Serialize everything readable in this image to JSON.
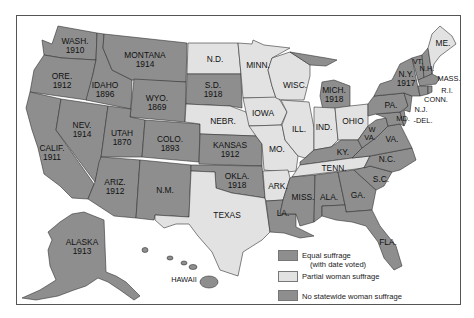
{
  "map": {
    "title": "",
    "colors": {
      "equal": "#8e8e8e",
      "partial": "#e2e2e2",
      "none": "#8e8e8e",
      "border": "#333333",
      "frame": "#555555"
    },
    "states": [
      {
        "id": "wa",
        "abbr": "WASH.",
        "year": "1910",
        "status": "equal"
      },
      {
        "id": "or",
        "abbr": "ORE.",
        "year": "1912",
        "status": "equal"
      },
      {
        "id": "ca",
        "abbr": "CALIF.",
        "year": "1911",
        "status": "equal"
      },
      {
        "id": "id",
        "abbr": "IDAHO",
        "year": "1896",
        "status": "equal"
      },
      {
        "id": "nv",
        "abbr": "NEV.",
        "year": "1914",
        "status": "equal"
      },
      {
        "id": "mt",
        "abbr": "MONTANA",
        "year": "1914",
        "status": "equal"
      },
      {
        "id": "wy",
        "abbr": "WYO.",
        "year": "1869",
        "status": "equal"
      },
      {
        "id": "ut",
        "abbr": "UTAH",
        "year": "1870",
        "status": "equal"
      },
      {
        "id": "co",
        "abbr": "COLO.",
        "year": "1893",
        "status": "equal"
      },
      {
        "id": "az",
        "abbr": "ARIZ.",
        "year": "1912",
        "status": "equal"
      },
      {
        "id": "nm",
        "abbr": "N.M.",
        "year": "",
        "status": "none"
      },
      {
        "id": "nd",
        "abbr": "N.D.",
        "year": "",
        "status": "partial"
      },
      {
        "id": "sd",
        "abbr": "S.D.",
        "year": "1918",
        "status": "equal"
      },
      {
        "id": "ne",
        "abbr": "NEBR.",
        "year": "",
        "status": "partial"
      },
      {
        "id": "ks",
        "abbr": "KANSAS",
        "year": "1912",
        "status": "equal"
      },
      {
        "id": "ok",
        "abbr": "OKLA.",
        "year": "1918",
        "status": "equal"
      },
      {
        "id": "tx",
        "abbr": "TEXAS",
        "year": "",
        "status": "partial"
      },
      {
        "id": "mn",
        "abbr": "MINN.",
        "year": "",
        "status": "partial"
      },
      {
        "id": "ia",
        "abbr": "IOWA",
        "year": "",
        "status": "partial"
      },
      {
        "id": "mo",
        "abbr": "MO.",
        "year": "",
        "status": "partial"
      },
      {
        "id": "ar",
        "abbr": "ARK.",
        "year": "",
        "status": "partial"
      },
      {
        "id": "la",
        "abbr": "LA.",
        "year": "",
        "status": "none"
      },
      {
        "id": "wi",
        "abbr": "WISC.",
        "year": "",
        "status": "partial"
      },
      {
        "id": "il",
        "abbr": "ILL.",
        "year": "",
        "status": "partial"
      },
      {
        "id": "mi",
        "abbr": "MICH.",
        "year": "1918",
        "status": "equal"
      },
      {
        "id": "in",
        "abbr": "IND.",
        "year": "",
        "status": "partial"
      },
      {
        "id": "oh",
        "abbr": "OHIO",
        "year": "",
        "status": "partial"
      },
      {
        "id": "ky",
        "abbr": "KY.",
        "year": "",
        "status": "none"
      },
      {
        "id": "tn",
        "abbr": "TENN.",
        "year": "",
        "status": "partial"
      },
      {
        "id": "ms",
        "abbr": "MISS.",
        "year": "",
        "status": "none"
      },
      {
        "id": "al",
        "abbr": "ALA.",
        "year": "",
        "status": "none"
      },
      {
        "id": "ga",
        "abbr": "GA.",
        "year": "",
        "status": "none"
      },
      {
        "id": "fl",
        "abbr": "FLA.",
        "year": "",
        "status": "none"
      },
      {
        "id": "sc",
        "abbr": "S.C.",
        "year": "",
        "status": "none"
      },
      {
        "id": "nc",
        "abbr": "N.C.",
        "year": "",
        "status": "none"
      },
      {
        "id": "va",
        "abbr": "VA.",
        "year": "",
        "status": "none"
      },
      {
        "id": "wv",
        "abbr": "W\nVA.",
        "year": "",
        "status": "none"
      },
      {
        "id": "md",
        "abbr": "MD.",
        "year": "",
        "status": "none"
      },
      {
        "id": "de",
        "abbr": "DEL.",
        "year": "",
        "status": "none"
      },
      {
        "id": "pa",
        "abbr": "PA.",
        "year": "",
        "status": "none"
      },
      {
        "id": "nj",
        "abbr": "N.J.",
        "year": "",
        "status": "none"
      },
      {
        "id": "ny",
        "abbr": "N.Y.",
        "year": "1917",
        "status": "equal"
      },
      {
        "id": "ct",
        "abbr": "CONN.",
        "year": "",
        "status": "none"
      },
      {
        "id": "ri",
        "abbr": "R.I.",
        "year": "",
        "status": "none"
      },
      {
        "id": "ma",
        "abbr": "MASS.",
        "year": "",
        "status": "none"
      },
      {
        "id": "vt",
        "abbr": "VT.",
        "year": "",
        "status": "none"
      },
      {
        "id": "nh",
        "abbr": "N.H.",
        "year": "",
        "status": "none"
      },
      {
        "id": "me",
        "abbr": "ME.",
        "year": "",
        "status": "partial"
      },
      {
        "id": "ak",
        "abbr": "ALASKA",
        "year": "1913",
        "status": "equal"
      },
      {
        "id": "hi",
        "abbr": "HAWAII",
        "year": "",
        "status": "none"
      }
    ],
    "labels": {
      "wa": [
        "WASH.",
        "1910"
      ],
      "or": [
        "ORE.",
        "1912"
      ],
      "ca": [
        "CALIF.",
        "1911"
      ],
      "id": [
        "IDAHO",
        "1896"
      ],
      "nv": [
        "NEV.",
        "1914"
      ],
      "mt": [
        "MONTANA",
        "1914"
      ],
      "wy": [
        "WYO.",
        "1869"
      ],
      "ut": [
        "UTAH",
        "1870"
      ],
      "co": [
        "COLO.",
        "1893"
      ],
      "az": [
        "ARIZ.",
        "1912"
      ],
      "nm": "N.M.",
      "nd": "N.D.",
      "sd": [
        "S.D.",
        "1918"
      ],
      "ne": "NEBR.",
      "ks": [
        "KANSAS",
        "1912"
      ],
      "ok": [
        "OKLA.",
        "1918"
      ],
      "tx": "TEXAS",
      "mn": "MINN.",
      "ia": "IOWA",
      "mo": "MO.",
      "ar": "ARK.",
      "la": "LA.",
      "wi": "WISC.",
      "il": "ILL.",
      "mi": [
        "MICH.",
        "1918"
      ],
      "in": "IND.",
      "oh": "OHIO",
      "ky": "KY.",
      "tn": "TENN.",
      "ms": "MISS.",
      "al": "ALA.",
      "ga": "GA.",
      "fl": "FLA.",
      "sc": "S.C.",
      "nc": "N.C.",
      "va": "VA.",
      "wv": [
        "W",
        "VA."
      ],
      "md": "MD.",
      "de": "-DEL.",
      "pa": "PA.",
      "nj": "N.J.",
      "ny": [
        "N.Y.",
        "1917"
      ],
      "ct": "CONN.",
      "ri": "R.I.",
      "ma": "MASS.",
      "vt": "VT.",
      "nh": "N.H.",
      "me": "ME.",
      "ak": [
        "ALASKA",
        "1913"
      ],
      "hi": "HAWAII"
    }
  },
  "legend": {
    "items": [
      {
        "label": "Equal suffrage",
        "sublabel": "(with date voted)",
        "color": "#8e8e8e"
      },
      {
        "label": "Partial woman suffrage",
        "sublabel": "",
        "color": "#e2e2e2"
      },
      {
        "label": "No statewide woman suffrage",
        "sublabel": "",
        "color": "#8e8e8e"
      }
    ]
  }
}
